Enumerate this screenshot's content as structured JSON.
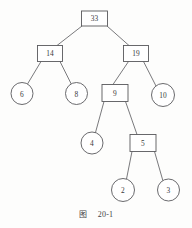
{
  "figure": {
    "type": "binary-tree-diagram",
    "caption_cjk": "图",
    "caption_number": "20-1",
    "stroke_color": "#59595c",
    "fill_color": "#ffffff",
    "background_color": "#fdfdfc",
    "nodes": [
      {
        "id": "n33",
        "label": "33",
        "shape": "rect",
        "cx": 94.5,
        "cy": 18.5,
        "w": 26,
        "h": 15
      },
      {
        "id": "n14",
        "label": "14",
        "shape": "rect",
        "cx": 50.0,
        "cy": 53.5,
        "w": 25,
        "h": 16
      },
      {
        "id": "n19",
        "label": "19",
        "shape": "rect",
        "cx": 136.0,
        "cy": 53.5,
        "w": 25,
        "h": 16
      },
      {
        "id": "n6",
        "label": "6",
        "shape": "circle",
        "cx": 22.0,
        "cy": 93.5,
        "r": 11.0
      },
      {
        "id": "n8",
        "label": "8",
        "shape": "circle",
        "cx": 76.5,
        "cy": 93.5,
        "r": 11.0
      },
      {
        "id": "n9",
        "label": "9",
        "shape": "rect",
        "cx": 115.0,
        "cy": 93.0,
        "w": 26,
        "h": 17
      },
      {
        "id": "n10",
        "label": "10",
        "shape": "circle",
        "cx": 163.0,
        "cy": 95.0,
        "r": 11.5
      },
      {
        "id": "n4",
        "label": "4",
        "shape": "circle",
        "cx": 92.0,
        "cy": 143.0,
        "r": 11.0
      },
      {
        "id": "n5",
        "label": "5",
        "shape": "rect",
        "cx": 143.0,
        "cy": 143.0,
        "w": 26,
        "h": 17
      },
      {
        "id": "n2",
        "label": "2",
        "shape": "circle",
        "cx": 123.0,
        "cy": 190.0,
        "r": 11.5
      },
      {
        "id": "n3",
        "label": "3",
        "shape": "circle",
        "cx": 168.5,
        "cy": 190.0,
        "r": 11.0
      }
    ],
    "edges": [
      {
        "from": "n33",
        "to": "n14",
        "x1": 82.0,
        "y1": 26.0,
        "x2": 57.0,
        "y2": 45.5
      },
      {
        "from": "n33",
        "to": "n19",
        "x1": 107.0,
        "y1": 26.0,
        "x2": 129.0,
        "y2": 45.5
      },
      {
        "from": "n14",
        "to": "n6",
        "x1": 41.0,
        "y1": 61.5,
        "x2": 27.5,
        "y2": 84.0
      },
      {
        "from": "n14",
        "to": "n8",
        "x1": 60.0,
        "y1": 61.5,
        "x2": 71.5,
        "y2": 84.5
      },
      {
        "from": "n19",
        "to": "n9",
        "x1": 128.5,
        "y1": 61.5,
        "x2": 113.0,
        "y2": 84.5
      },
      {
        "from": "n19",
        "to": "n10",
        "x1": 143.5,
        "y1": 61.5,
        "x2": 156.0,
        "y2": 86.0
      },
      {
        "from": "n9",
        "to": "n4",
        "x1": 104.0,
        "y1": 101.5,
        "x2": 95.5,
        "y2": 132.5
      },
      {
        "from": "n9",
        "to": "n5",
        "x1": 125.5,
        "y1": 101.5,
        "x2": 137.0,
        "y2": 134.5
      },
      {
        "from": "n5",
        "to": "n2",
        "x1": 132.0,
        "y1": 151.5,
        "x2": 126.5,
        "y2": 179.0
      },
      {
        "from": "n5",
        "to": "n3",
        "x1": 154.5,
        "y1": 151.5,
        "x2": 163.0,
        "y2": 181.0
      }
    ]
  }
}
